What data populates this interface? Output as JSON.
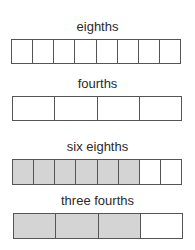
{
  "figure": {
    "shade_color": "#d4d4d4",
    "rows": [
      {
        "label": "eighths",
        "parts": 8,
        "shaded": 0
      },
      {
        "label": "fourths",
        "parts": 4,
        "shaded": 0
      },
      {
        "label": "six eighths",
        "parts": 8,
        "shaded": 6
      },
      {
        "label": "three fourths",
        "parts": 4,
        "shaded": 3
      }
    ]
  }
}
